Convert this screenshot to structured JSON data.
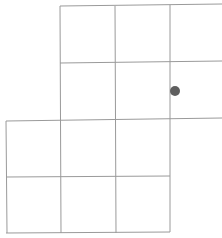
{
  "diagram": {
    "type": "grid",
    "line_color": "#9a9a9a",
    "dot_color": "#5f5f5f",
    "lines": [
      {
        "x1": 60,
        "y1": 6,
        "x2": 222,
        "y2": 4
      },
      {
        "x1": 60,
        "y1": 63,
        "x2": 222,
        "y2": 61
      },
      {
        "x1": 6,
        "y1": 121,
        "x2": 222,
        "y2": 118
      },
      {
        "x1": 6,
        "y1": 177,
        "x2": 170,
        "y2": 176
      },
      {
        "x1": 6,
        "y1": 233,
        "x2": 170,
        "y2": 232
      },
      {
        "x1": 60,
        "y1": 6,
        "x2": 61,
        "y2": 233
      },
      {
        "x1": 115,
        "y1": 6,
        "x2": 116,
        "y2": 233
      },
      {
        "x1": 170,
        "y1": 5,
        "x2": 170,
        "y2": 232
      },
      {
        "x1": 6,
        "y1": 121,
        "x2": 7,
        "y2": 233
      }
    ],
    "dot": {
      "cx": 175,
      "cy": 91,
      "r": 5
    }
  }
}
